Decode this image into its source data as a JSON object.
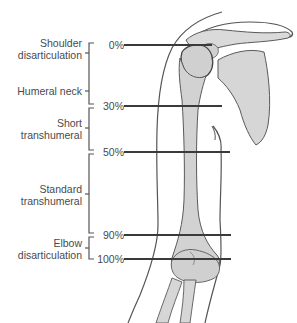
{
  "diagram": {
    "levels": [
      {
        "name": "Shoulder disarticulation",
        "line1": "Shoulder",
        "line2": "disarticulation"
      },
      {
        "name": "Humeral neck",
        "line1": "Humeral neck"
      },
      {
        "name": "Short transhumeral",
        "line1": "Short",
        "line2": "transhumeral"
      },
      {
        "name": "Standard transhumeral",
        "line1": "Standard",
        "line2": "transhumeral"
      },
      {
        "name": "Elbow disarticulation",
        "line1": "Elbow",
        "line2": "disarticulation"
      }
    ],
    "percent_marks": [
      {
        "label": "0%",
        "y": 45
      },
      {
        "label": "30%",
        "y": 106
      },
      {
        "label": "50%",
        "y": 152
      },
      {
        "label": "90%",
        "y": 235
      },
      {
        "label": "100%",
        "y": 259
      }
    ],
    "colors": {
      "text": "#4a4a4a",
      "lines": "#3a3a3a",
      "bone_fill": "#d4d4d4",
      "bone_stroke": "#5a5a5a",
      "skin_stroke": "#555555"
    }
  }
}
